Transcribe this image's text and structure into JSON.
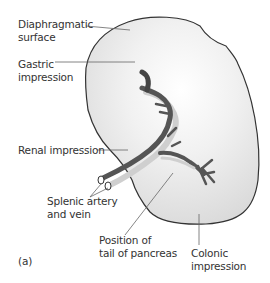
{
  "figure": {
    "panel_label": "(a)",
    "labels": {
      "diaphragmatic": "Diaphragmatic\nsurface",
      "gastric": "Gastric\nimpression",
      "renal": "Renal impression",
      "splenic": "Splenic artery\nand vein",
      "pancreas": "Position of\ntail of pancreas",
      "colonic": "Colonic\nimpression"
    },
    "colors": {
      "organ_fill": "#e9e9e9",
      "organ_outline": "#333333",
      "artery": "#555555",
      "vein": "#cfcfcf",
      "leader_line": "#666666",
      "text": "#333333"
    }
  }
}
